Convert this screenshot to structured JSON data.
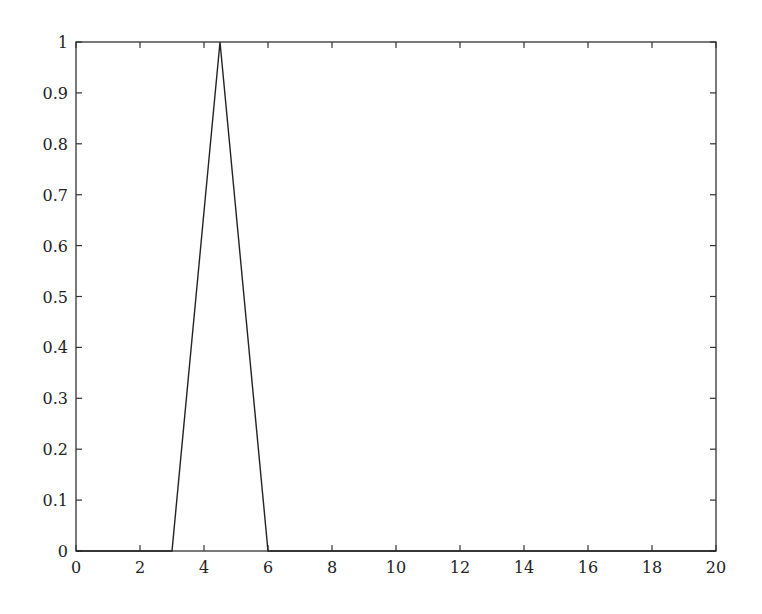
{
  "chart_data": {
    "type": "line",
    "title": "",
    "xlabel": "",
    "ylabel": "",
    "xlim": [
      0,
      20
    ],
    "ylim": [
      0,
      1
    ],
    "grid": false,
    "legend": null,
    "x_ticks": [
      "0",
      "2",
      "4",
      "6",
      "8",
      "10",
      "12",
      "14",
      "16",
      "18",
      "20"
    ],
    "y_ticks": [
      "0",
      "0.1",
      "0.2",
      "0.3",
      "0.4",
      "0.5",
      "0.6",
      "0.7",
      "0.8",
      "0.9",
      "1"
    ],
    "series": [
      {
        "name": "triangular membership",
        "x": [
          0,
          3,
          4.5,
          6,
          20
        ],
        "y": [
          0,
          0,
          1,
          0,
          0
        ]
      }
    ]
  },
  "colors": {
    "line": "#222222",
    "axis": "#333333"
  }
}
